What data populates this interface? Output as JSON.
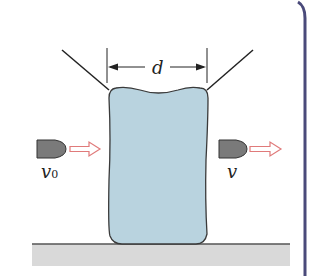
{
  "diagram": {
    "labels": {
      "width": "d",
      "initial_velocity": "v",
      "initial_velocity_subscript": "0",
      "final_velocity": "v"
    },
    "colors": {
      "block_fill": "#b9d3df",
      "block_stroke": "#3a3a3a",
      "bullet_fill": "#7a7a7a",
      "bullet_stroke": "#333333",
      "arrow_stroke": "#e07a7a",
      "arrow_fill": "#ffffff",
      "ground_fill": "#d9d9d9",
      "ground_line": "#555555",
      "frame_border": "#4a4a7a",
      "line_color": "#222222"
    }
  }
}
